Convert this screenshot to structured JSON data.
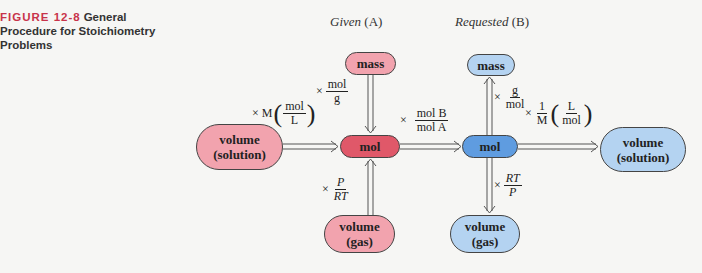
{
  "caption": {
    "figure_label": "FIGURE 12-8",
    "title": "General Procedure for Stoichiometry Problems"
  },
  "columns": {
    "given": {
      "word": "Given",
      "tag": "(A)"
    },
    "requested": {
      "word": "Requested",
      "tag": "(B)"
    }
  },
  "nodes": {
    "given_mass": "mass",
    "given_mol": "mol",
    "given_volume_solution": [
      "volume",
      "(solution)"
    ],
    "given_volume_gas": [
      "volume",
      "(gas)"
    ],
    "requested_mass": "mass",
    "requested_mol": "mol",
    "requested_volume_solution": [
      "volume",
      "(solution)"
    ],
    "requested_volume_gas": [
      "volume",
      "(gas)"
    ]
  },
  "conversions": {
    "mass_to_mol": {
      "times": "×",
      "num": "mol",
      "den": "g"
    },
    "solution_to_mol": {
      "times": "×",
      "prefix": "M",
      "num": "mol",
      "den": "L"
    },
    "gas_to_mol": {
      "times": "×",
      "num": "P",
      "den": "RT"
    },
    "mol_a_to_mol_b": {
      "times": "×",
      "num": "mol B",
      "den": "mol A"
    },
    "mol_to_mass": {
      "times": "×",
      "num": "g",
      "den": "mol"
    },
    "mol_to_solution": {
      "times": "×",
      "pre_num": "1",
      "pre_den": "M",
      "num": "L",
      "den": "mol"
    },
    "mol_to_gas": {
      "times": "×",
      "num": "RT",
      "den": "P"
    }
  },
  "colors": {
    "figure_label": "#c8334a",
    "given_light": "#f2a3ae",
    "given_dark": "#e05869",
    "requested_light": "#b4d3f1",
    "requested_dark": "#5f9ce0"
  }
}
